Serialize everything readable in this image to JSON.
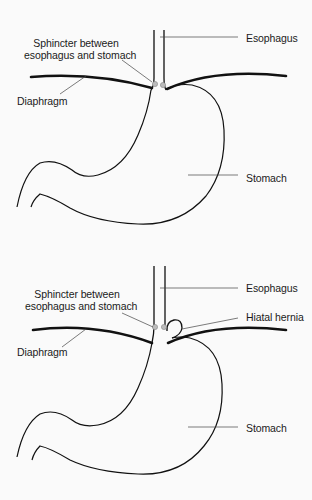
{
  "figures": [
    {
      "name": "normal-anatomy",
      "labels": {
        "sphincter_line1": "Sphincter between",
        "sphincter_line2": "esophagus and stomach",
        "esophagus": "Esophagus",
        "diaphragm": "Diaphragm",
        "stomach": "Stomach"
      }
    },
    {
      "name": "hiatal-hernia-anatomy",
      "labels": {
        "sphincter_line1": "Sphincter between",
        "sphincter_line2": "esophagus and stomach",
        "esophagus": "Esophagus",
        "hiatal_hernia": "Hiatal hernia",
        "diaphragm": "Diaphragm",
        "stomach": "Stomach"
      }
    }
  ],
  "colors": {
    "line": "#111111",
    "leader": "#444444",
    "sphincter": "#9a9a9a",
    "background": "#fafafa"
  }
}
